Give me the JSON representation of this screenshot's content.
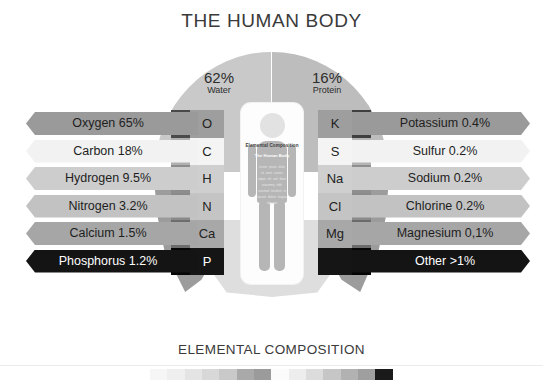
{
  "title": "THE HUMAN BODY",
  "footer_caption": "ELEMENTAL COMPOSITION",
  "center_card": {
    "title": "Elemental Composition",
    "subtitle": "The Human Body",
    "body_text": "Lorem ipsum dolor sit amet consec adipis elit sed diam nonummy nibh euismod tincidunt ut laoreet dolore magna aliquam"
  },
  "donut": {
    "segments": [
      {
        "name": "water",
        "percent": "62%",
        "label": "Water",
        "color": "#c9c9c9"
      },
      {
        "name": "protein",
        "percent": "16%",
        "label": "Protein",
        "color": "#bdbdbd"
      },
      {
        "name": "minerals",
        "percent": "6%",
        "label": "Minerals",
        "color": "#9c9c9c"
      },
      {
        "name": "fat",
        "percent": "16%",
        "label": "Fat",
        "color": "#9c9c9c"
      },
      {
        "name": "carbohydrate",
        "percent": "1%",
        "label": "Carbohydrate",
        "color": "#dedede"
      }
    ]
  },
  "left_elements": [
    {
      "symbol": "O",
      "label": "Oxygen 65%",
      "sym_bg": "#9e9e9e",
      "sym_dark": false,
      "side_bg": "#4a4a4a",
      "bar_bg": "#9a9a9a",
      "bar_dark": false
    },
    {
      "symbol": "C",
      "label": "Carbon 18%",
      "sym_bg": "#f4f4f4",
      "sym_dark": false,
      "side_bg": "#b0b0b0",
      "bar_bg": "#f2f2f2",
      "bar_dark": false
    },
    {
      "symbol": "H",
      "label": "Hydrogen 9.5%",
      "sym_bg": "#cfcfcf",
      "sym_dark": false,
      "side_bg": "#8d8d8d",
      "bar_bg": "#cdcdcd",
      "bar_dark": false
    },
    {
      "symbol": "N",
      "label": "Nitrogen 3.2%",
      "sym_bg": "#c4c4c4",
      "sym_dark": false,
      "side_bg": "#8a8a8a",
      "bar_bg": "#c2c2c2",
      "bar_dark": false
    },
    {
      "symbol": "Ca",
      "label": "Calcium 1.5%",
      "sym_bg": "#a8a8a8",
      "sym_dark": false,
      "side_bg": "#6d6d6d",
      "bar_bg": "#a6a6a6",
      "bar_dark": false
    },
    {
      "symbol": "P",
      "label": "Phosphorus 1.2%",
      "sym_bg": "#151515",
      "sym_dark": true,
      "side_bg": "#050505",
      "bar_bg": "#141414",
      "bar_dark": true
    }
  ],
  "right_elements": [
    {
      "symbol": "K",
      "label": "Potassium 0.4%",
      "sym_bg": "#9e9e9e",
      "sym_dark": false,
      "side_bg": "#3f3f3f",
      "bar_bg": "#9a9a9a",
      "bar_dark": false
    },
    {
      "symbol": "S",
      "label": "Sulfur 0.2%",
      "sym_bg": "#f4f4f4",
      "sym_dark": false,
      "side_bg": "#b4b4b4",
      "bar_bg": "#f2f2f2",
      "bar_dark": false
    },
    {
      "symbol": "Na",
      "label": "Sodium 0.2%",
      "sym_bg": "#cfcfcf",
      "sym_dark": false,
      "side_bg": "#8f8f8f",
      "bar_bg": "#cdcdcd",
      "bar_dark": false
    },
    {
      "symbol": "Cl",
      "label": "Chlorine 0.2%",
      "sym_bg": "#c4c4c4",
      "sym_dark": false,
      "side_bg": "#8a8a8a",
      "bar_bg": "#c2c2c2",
      "bar_dark": false
    },
    {
      "symbol": "Mg",
      "label": "Magnesium 0,1%",
      "sym_bg": "#a8a8a8",
      "sym_dark": false,
      "side_bg": "#6b6b6b",
      "bar_bg": "#a6a6a6",
      "bar_dark": false
    },
    {
      "symbol": "",
      "label": "Other >1%",
      "sym_bg": "#151515",
      "sym_dark": true,
      "side_bg": "#050505",
      "bar_bg": "#141414",
      "bar_dark": true
    }
  ],
  "swatch_bar": {
    "colors": [
      "#f6f6f6",
      "#efefef",
      "#e4e4e4",
      "#d8d8d8",
      "#c9c9c9",
      "#a9a9a9",
      "#9b9b9b",
      "#fbfbfb",
      "#ededed",
      "#dcdcdc",
      "#c6c6c6",
      "#b2b2b2",
      "#9f9f9f",
      "#1a1a1a"
    ]
  }
}
